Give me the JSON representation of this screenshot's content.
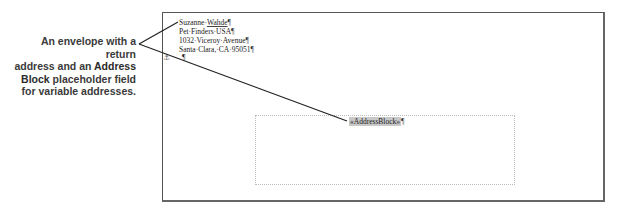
{
  "caption": {
    "line1": "An envelope with a return",
    "line2_prefix": "address and an ",
    "line2_strong": "Address",
    "line3_strong": "Block",
    "line3_suffix": " placeholder field",
    "line4": "for variable addresses."
  },
  "envelope": {
    "return_address": {
      "name_first": "Suzanne·",
      "name_last": "Wahde",
      "line2": "Pet·Finders·USA",
      "line3": "1032·Viceroy·Avenue",
      "line4": "Santa·Clara,·CA·95051",
      "pilcrow": "¶"
    },
    "empty_paragraph": "¶",
    "anchor_icon": "⚓",
    "address_block": {
      "field_text": "«AddressBlock»",
      "pilcrow": "¶"
    }
  },
  "colors": {
    "caption_text": "#3a3a3a",
    "envelope_border": "#555555",
    "field_shading": "#c8c8c8",
    "callout_line": "#222222"
  }
}
